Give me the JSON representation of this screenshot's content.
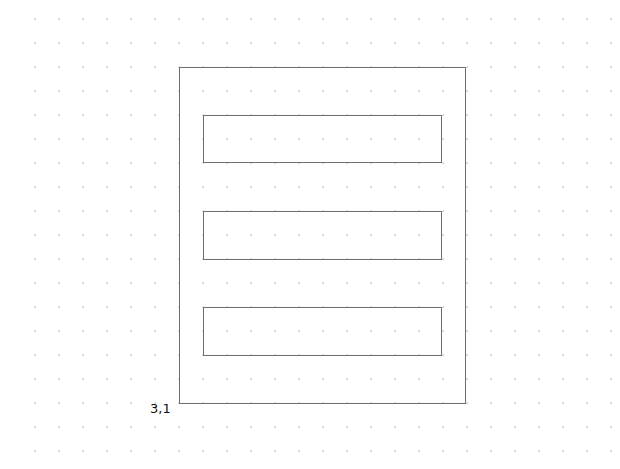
{
  "canvas": {
    "width": 620,
    "height": 469,
    "background": "#ffffff"
  },
  "grid": {
    "origin_x": 35,
    "origin_y": 19,
    "spacing": 24,
    "dot_color": "#9a9a9a"
  },
  "shapes": {
    "stroke_color": "#6e6e6e",
    "outer_rect": {
      "x": 179,
      "y": 67,
      "width": 286,
      "height": 336
    },
    "inner_rects": [
      {
        "x": 203,
        "y": 115,
        "width": 238,
        "height": 47
      },
      {
        "x": 203,
        "y": 211,
        "width": 238,
        "height": 48
      },
      {
        "x": 203,
        "y": 307,
        "width": 238,
        "height": 48
      }
    ]
  },
  "labels": {
    "origin_coordinate": "3,1"
  }
}
